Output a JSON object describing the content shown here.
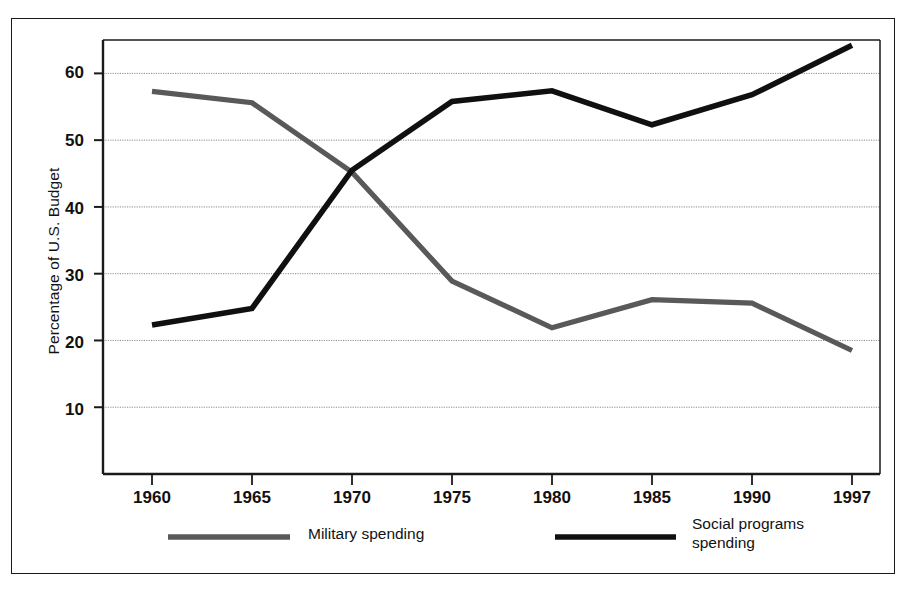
{
  "chart_data": {
    "type": "line",
    "title": "",
    "xlabel": "",
    "ylabel": "Percentage of U.S. Budget",
    "x": [
      1960,
      1965,
      1970,
      1975,
      1980,
      1985,
      1990,
      1997
    ],
    "xtick_labels": [
      "1960",
      "1965",
      "1970",
      "1975",
      "1980",
      "1985",
      "1990",
      "1997"
    ],
    "ytick_labels": [
      "60",
      "50",
      "40",
      "30",
      "20",
      "10"
    ],
    "yticks": [
      60,
      50,
      40,
      30,
      20,
      10
    ],
    "ylim": [
      0,
      65
    ],
    "xlim": [
      1957.5,
      1999.5
    ],
    "grid": true,
    "grid_axis": "y",
    "legend_position": "below-axes",
    "series": [
      {
        "name": "Military spending",
        "color": "#595959",
        "values": [
          57.3,
          55.6,
          45.2,
          28.9,
          21.9,
          26.1,
          25.6,
          18.5
        ]
      },
      {
        "name": "Social programs spending",
        "color": "#101010",
        "values": [
          22.3,
          24.8,
          45.5,
          55.8,
          57.4,
          52.3,
          56.8,
          64.2
        ]
      }
    ]
  },
  "legend": {
    "items": [
      {
        "label": "Military spending",
        "color": "#595959"
      },
      {
        "label": "Social programs\nspending",
        "color": "#101010"
      }
    ]
  },
  "colors": {
    "military": "#595959",
    "social": "#101010",
    "axis": "#1a1a1a",
    "grid": "#8a8a8a",
    "background": "#ffffff"
  }
}
